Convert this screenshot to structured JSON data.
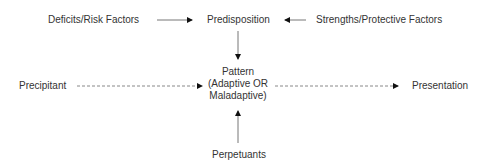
{
  "diagram": {
    "nodes": {
      "deficits": "Deficits/Risk Factors",
      "predisposition": "Predisposition",
      "strengths": "Strengths/Protective Factors",
      "precipitant": "Precipitant",
      "pattern_line1": "Pattern",
      "pattern_line2": "(Adaptive OR",
      "pattern_line3": "Maladaptive)",
      "presentation": "Presentation",
      "perpetuants": "Perpetuants"
    },
    "edges": [
      {
        "from": "Deficits/Risk Factors",
        "to": "Predisposition",
        "style": "solid"
      },
      {
        "from": "Strengths/Protective Factors",
        "to": "Predisposition",
        "style": "solid"
      },
      {
        "from": "Predisposition",
        "to": "Pattern",
        "style": "solid"
      },
      {
        "from": "Precipitant",
        "to": "Pattern",
        "style": "dashed"
      },
      {
        "from": "Pattern",
        "to": "Presentation",
        "style": "dashed"
      },
      {
        "from": "Perpetuants",
        "to": "Pattern",
        "style": "solid"
      }
    ],
    "colors": {
      "line": "#777777",
      "arrowhead": "#111111",
      "text": "#333333"
    }
  }
}
